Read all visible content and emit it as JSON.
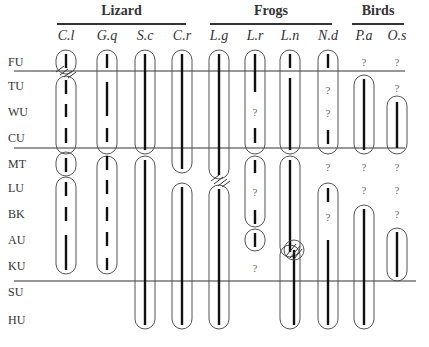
{
  "groups": [
    {
      "label": "Lizard",
      "x1": 57,
      "x2": 186
    },
    {
      "label": "Frogs",
      "x1": 210,
      "x2": 332
    },
    {
      "label": "Birds",
      "x1": 352,
      "x2": 404
    }
  ],
  "species": [
    {
      "label": "C.l",
      "x": 66
    },
    {
      "label": "G.q",
      "x": 107
    },
    {
      "label": "S.c",
      "x": 145
    },
    {
      "label": "C.r",
      "x": 182
    },
    {
      "label": "L.g",
      "x": 219
    },
    {
      "label": "L.r",
      "x": 255
    },
    {
      "label": "L.n",
      "x": 290
    },
    {
      "label": "N.d",
      "x": 328
    },
    {
      "label": "P.a",
      "x": 364
    },
    {
      "label": "O.s",
      "x": 397
    }
  ],
  "rows": [
    {
      "label": "FU",
      "y": 62
    },
    {
      "label": "TU",
      "y": 86
    },
    {
      "label": "WU",
      "y": 112
    },
    {
      "label": "CU",
      "y": 138
    },
    {
      "label": "MT",
      "y": 164
    },
    {
      "label": "LU",
      "y": 188
    },
    {
      "label": "BK",
      "y": 214
    },
    {
      "label": "AU",
      "y": 240
    },
    {
      "label": "KU",
      "y": 266
    },
    {
      "label": "SU",
      "y": 292
    },
    {
      "label": "HU",
      "y": 320
    }
  ],
  "dividers": [
    71,
    148,
    281
  ],
  "question_mark": "?",
  "diagram_title": "Species distribution across regions"
}
